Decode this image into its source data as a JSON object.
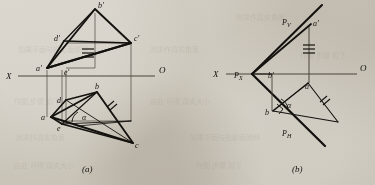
{
  "figure": {
    "caption_a": "(a)",
    "caption_b": "(b)",
    "background_color": "#cdc8bd",
    "ink_color": "#14120f",
    "thin_line_color": "#4a453d"
  },
  "axes": {
    "x_label": "X",
    "o_label": "O",
    "panel_a": {
      "x_label_x": 8,
      "o_label_x": 160,
      "y": 76
    },
    "panel_b": {
      "x_label_x": 215,
      "o_label_x": 362,
      "y": 74
    }
  },
  "panel_a": {
    "name": "orthographic-two-view-projection",
    "points": [
      {
        "id": "b-prime",
        "label": "b'",
        "x": 95,
        "y": 9,
        "lx": 98,
        "ly": 8
      },
      {
        "id": "c-prime",
        "label": "c'",
        "x": 131,
        "y": 43,
        "lx": 134,
        "ly": 41
      },
      {
        "id": "d-prime",
        "label": "d'",
        "x": 64,
        "y": 41,
        "lx": 55,
        "ly": 40
      },
      {
        "id": "a-prime",
        "label": "a'",
        "x": 47,
        "y": 68,
        "lx": 37,
        "ly": 70
      },
      {
        "id": "e-prime",
        "label": "e'",
        "x": 66,
        "y": 70,
        "lx": 65,
        "ly": 73
      },
      {
        "id": "b",
        "label": "b",
        "x": 97,
        "y": 92,
        "lx": 96,
        "ly": 89
      },
      {
        "id": "c",
        "label": "c",
        "x": 133,
        "y": 143,
        "lx": 135,
        "ly": 147
      },
      {
        "id": "d",
        "label": "d",
        "x": 66,
        "y": 100,
        "lx": 59,
        "ly": 102
      },
      {
        "id": "a",
        "label": "a",
        "x": 51,
        "y": 117,
        "lx": 42,
        "ly": 119
      },
      {
        "id": "e",
        "label": "e",
        "x": 62,
        "y": 124,
        "lx": 59,
        "ly": 129
      },
      {
        "id": "alpha",
        "label": "α",
        "x": 86,
        "y": 117,
        "lx": 83,
        "ly": 119
      }
    ],
    "tick_marks": {
      "triple": "≡",
      "single": "/"
    }
  },
  "panel_b": {
    "name": "trace-line-true-angle-construction",
    "points": [
      {
        "id": "Pv",
        "label": "P",
        "sub": "V",
        "x": 302,
        "y": 21,
        "lx": 283,
        "ly": 23
      },
      {
        "id": "a-prime",
        "label": "a'",
        "x": 311,
        "y": 23,
        "lx": 314,
        "ly": 24
      },
      {
        "id": "Px",
        "label": "P",
        "sub": "X",
        "x": 252,
        "y": 74,
        "lx": 236,
        "ly": 76
      },
      {
        "id": "b-prime",
        "label": "b'",
        "x": 272,
        "y": 74,
        "lx": 269,
        "ly": 76
      },
      {
        "id": "a",
        "label": "a",
        "x": 308,
        "y": 83,
        "lx": 306,
        "ly": 88
      },
      {
        "id": "b",
        "label": "b",
        "x": 273,
        "y": 111,
        "lx": 267,
        "ly": 114
      },
      {
        "id": "Ph",
        "label": "P",
        "sub": "H",
        "x": 289,
        "y": 130,
        "lx": 284,
        "ly": 134
      },
      {
        "id": "alpha",
        "label": "α",
        "x": 290,
        "y": 104,
        "lx": 288,
        "ly": 107
      }
    ],
    "tick_marks": {
      "triple": "≡",
      "double": "//"
    }
  },
  "bleed_text": {
    "note": "faint show-through text from reverse page",
    "lines": [
      "如果平面与投影面倾斜",
      "则求作真实角度",
      "作图 步骤 如下",
      "由此 可得 真实大小"
    ]
  }
}
